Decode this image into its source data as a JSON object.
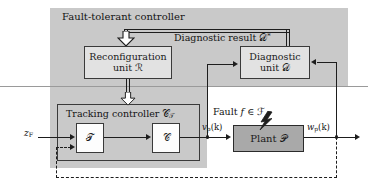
{
  "diagram": {
    "title": "Fault-tolerant controller",
    "regions": {
      "fault_tolerant_controller_label": "Fault-tolerant controller"
    },
    "blocks": {
      "reconfiguration_unit": {
        "line1": "Reconfiguration",
        "line2_prefix": "unit ",
        "line2_symbol": "ℛ"
      },
      "diagnostic_unit": {
        "line1": "Diagnostic",
        "line2_prefix": "unit ",
        "line2_symbol": "𝒟"
      },
      "tracking_controller": {
        "label_prefix": "Tracking controller ",
        "label_symbol": "𝒞",
        "label_subscript": "𝒯"
      },
      "t_block": {
        "symbol": "𝒯"
      },
      "c_block": {
        "symbol": "𝒞"
      },
      "plant": {
        "prefix": "Plant ",
        "symbol": "𝒫"
      }
    },
    "signals": {
      "reference_input": {
        "base": "z",
        "subscript": "F"
      },
      "plant_input": {
        "base": "v",
        "subscript": "p",
        "arg": "(k)"
      },
      "plant_output": {
        "base": "w",
        "subscript": "p",
        "arg": "(k)"
      },
      "diagnostic_result": {
        "text": "Diagnostic result ",
        "symbol": "𝒟",
        "superscript": "*"
      },
      "fault": {
        "text": "Fault ",
        "variable": "f",
        "member": " ∈ ",
        "set": "ℱ"
      }
    },
    "colors": {
      "region_shade": "#c9c9c9",
      "box_light": "#e2e2e2",
      "box_white": "#fdfdfd",
      "plant_fill": "#a9a9a9",
      "line": "#1d1d1d",
      "border": "#3a3a3a",
      "separator": "#9a9a9a",
      "background": "#ffffff"
    },
    "icons": {
      "lightning": "lightning-bolt-icon",
      "block_arrow": "hollow-block-arrow-down-icon"
    }
  }
}
